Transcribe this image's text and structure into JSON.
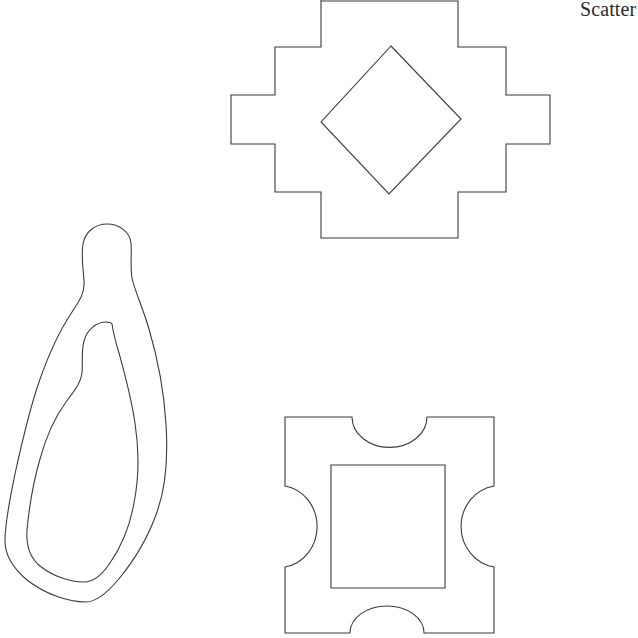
{
  "figure": {
    "title": "Scatter",
    "title_clipped": true,
    "background_color": "#ffffff",
    "stroke_color": "#3b3b3b",
    "width": 638,
    "height": 638
  },
  "shapes": [
    {
      "id": "stepped-cross",
      "name": "stepped-cross-outline",
      "description": "stepped cross / plus polygon",
      "path": "M 321 0 L 321 1 L 458 1 L 458 47 L 506 47 L 506 95 L 550 95 L 550 144 L 506 144 L 506 192 L 458 192 L 458 238 L 321 238 L 321 192 L 275 192 L 275 144 L 231 144 L 231 95 L 275 95 L 275 47 L 321 47 Z"
    },
    {
      "id": "inner-diamond",
      "name": "inner-diamond-outline",
      "description": "rotated square inside stepped cross",
      "path": "M 391 46 L 461 119 L 389 194 L 321 122 Z"
    },
    {
      "id": "outer-blob",
      "name": "outer-blob-outline",
      "description": "closed freeform teardrop blob outline",
      "path": "M 107 224 C 95 224 85 232 83 244 C 81 256 83 268 84 280 C 85 293 80 300 72 312 C 60 330 48 356 39 382 C 29 411 22 442 15 474 C 10 499 5 521 5 541 C 5 556 14 569 27 580 C 45 594 68 602 86 602 C 95 602 106 594 118 580 C 133 562 148 538 157 512 C 166 487 168 455 166 424 C 164 392 157 356 149 329 C 142 305 135 292 132 278 C 130 266 132 254 131 243 C 130 232 119 224 107 224 Z"
    },
    {
      "id": "inner-blob",
      "name": "inner-blob-outline",
      "description": "nested inner contour of the blob",
      "path": "M 106 322 C 96 322 87 330 84 341 C 81 352 83 364 82 373 C 81 383 74 391 66 402 C 55 417 46 437 40 459 C 33 483 29 509 27 530 C 26 546 30 558 40 566 C 52 576 70 582 84 582 C 93 582 102 575 110 563 C 121 547 130 526 134 503 C 139 478 139 449 135 423 C 131 396 124 371 119 353 C 115 340 113 331 112 324 C 111 322 109 322 106 322 Z"
    },
    {
      "id": "notched-square",
      "name": "notched-square-outline",
      "description": "square with four concave semicircular notches",
      "path": "M 285 417 L 352 417 A 37 30 0 0 0 427 417 L 494 417 L 494 486 A 39 41 0 0 0 494 567 L 494 633 L 424 633 A 37 27 0 0 0 350 633 L 285 633 L 285 567 A 38 41 0 0 0 285 486 Z"
    },
    {
      "id": "inner-square",
      "name": "inner-square-outline",
      "description": "axis-aligned square inside notched square",
      "path": "M 331 465 L 445 465 L 445 588 L 331 588 Z"
    }
  ]
}
